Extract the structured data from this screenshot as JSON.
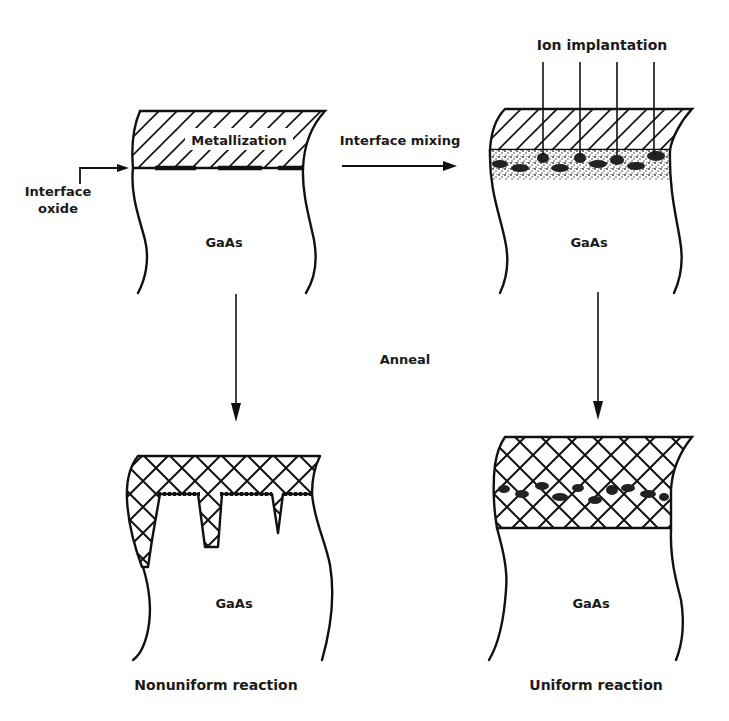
{
  "figure": {
    "colors": {
      "ink": "#111111",
      "background": "#ffffff",
      "stipple": "#555555"
    },
    "panels": [
      {
        "id": "as-deposited",
        "position": "top-left",
        "layer_label": "Metallization",
        "substrate_label": "GaAs",
        "callout": {
          "line1": "Interface",
          "line2": "oxide"
        },
        "layer_pattern": "diagonal-hatch"
      },
      {
        "id": "ion-mixed",
        "position": "top-right",
        "top_label": "Ion implantation",
        "substrate_label": "GaAs",
        "layer_pattern": "diagonal-hatch",
        "interface_pattern": "stippled-mixed-zone",
        "ion_beam_count": 4
      },
      {
        "id": "nonuniform",
        "position": "bottom-left",
        "substrate_label": "GaAs",
        "caption": "Nonuniform reaction",
        "layer_pattern": "cross-hatch"
      },
      {
        "id": "uniform",
        "position": "bottom-right",
        "substrate_label": "GaAs",
        "caption": "Uniform reaction",
        "layer_pattern": "cross-hatch"
      }
    ],
    "transitions": {
      "horizontal": "Interface mixing",
      "vertical": "Anneal"
    }
  }
}
